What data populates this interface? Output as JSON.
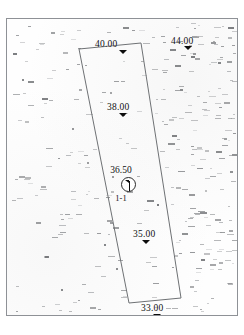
{
  "map": {
    "title": "Structure Contour Map",
    "frame": {
      "border_color": "#8e9196",
      "background": "#fefefe"
    },
    "tract": {
      "name": "survey-tract-outline",
      "stroke_color": "#6d7073",
      "points": "72,30 134,24 174,279 122,284"
    },
    "contours": [
      {
        "id": "c-40",
        "value": "40.00",
        "label_x": 88,
        "label_y": 20,
        "tri_x": 112,
        "tri_y": 31,
        "size": "lg"
      },
      {
        "id": "c-44",
        "value": "44.00",
        "label_x": 164,
        "label_y": 17,
        "tri_x": 177,
        "tri_y": 27,
        "size": "lg"
      },
      {
        "id": "c-38",
        "value": "38.00",
        "label_x": 100,
        "label_y": 83,
        "tri_x": 112,
        "tri_y": 94,
        "size": "lg"
      },
      {
        "id": "c-35",
        "value": "35.00",
        "label_x": 126,
        "label_y": 210,
        "tri_x": 135,
        "tri_y": 221,
        "size": "lg"
      },
      {
        "id": "c-33",
        "value": "33.00",
        "label_x": 134,
        "label_y": 284,
        "tri_x": 146,
        "tri_y": 295,
        "size": "lg"
      }
    ],
    "well": {
      "name": "well-1-1",
      "depth_label": "36.50",
      "id_label": "1-1",
      "x": 114,
      "y": 158,
      "symbol": "well-derrick-icon"
    },
    "caption": "",
    "posted_values_note": "dense field of illegible posted elevation marks"
  }
}
